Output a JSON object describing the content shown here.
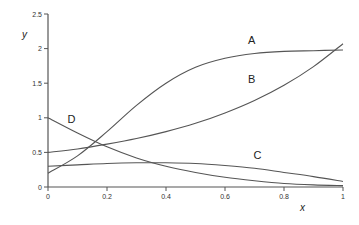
{
  "chart_data": {
    "type": "line",
    "title": "",
    "xlabel": "x",
    "ylabel": "y",
    "xlim": [
      0,
      1
    ],
    "ylim": [
      0,
      2.5
    ],
    "grid": false,
    "legend": "inline labels",
    "x_ticks": [
      "0",
      "0.2",
      "0.4",
      "0.6",
      "0.8",
      "1"
    ],
    "y_ticks": [
      "0",
      "0.5",
      "1",
      "1.5",
      "2",
      "2.5"
    ],
    "x": [
      0,
      0.1,
      0.2,
      0.3,
      0.4,
      0.5,
      0.6,
      0.7,
      0.8,
      0.9,
      1.0
    ],
    "series": [
      {
        "name": "A",
        "label_pos": [
          0.69,
          2.06
        ],
        "values": [
          0.2,
          0.45,
          0.8,
          1.18,
          1.5,
          1.73,
          1.86,
          1.93,
          1.96,
          1.97,
          1.98
        ]
      },
      {
        "name": "B",
        "label_pos": [
          0.69,
          1.5
        ],
        "values": [
          0.5,
          0.55,
          0.62,
          0.7,
          0.8,
          0.92,
          1.07,
          1.25,
          1.47,
          1.74,
          2.07
        ]
      },
      {
        "name": "C",
        "label_pos": [
          0.71,
          0.4
        ],
        "values": [
          0.3,
          0.32,
          0.34,
          0.35,
          0.35,
          0.34,
          0.31,
          0.27,
          0.21,
          0.15,
          0.08
        ]
      },
      {
        "name": "D",
        "label_pos": [
          0.08,
          0.93
        ],
        "values": [
          1.0,
          0.78,
          0.58,
          0.42,
          0.3,
          0.21,
          0.14,
          0.09,
          0.05,
          0.03,
          0.02
        ]
      }
    ]
  },
  "axes": {
    "xlabel": "x",
    "ylabel": "y"
  }
}
